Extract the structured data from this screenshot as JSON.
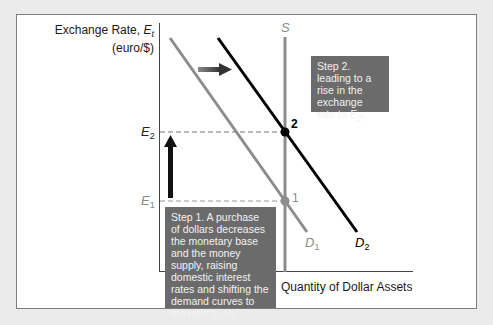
{
  "diagram": {
    "y_axis": {
      "title": "Exchange Rate, ",
      "title_var": "E",
      "title_sub": "t",
      "unit": "(euro/$)"
    },
    "x_axis": {
      "title": "Quantity of Dollar Assets"
    },
    "ticks": {
      "e2": {
        "var": "E",
        "sub": "2"
      },
      "e1": {
        "var": "E",
        "sub": "1"
      }
    },
    "curves": {
      "supply": {
        "label": "S",
        "color": "#8c8c8c"
      },
      "d1": {
        "var": "D",
        "sub": "1",
        "color": "#8c8c8c"
      },
      "d2": {
        "var": "D",
        "sub": "2",
        "color": "#000000"
      }
    },
    "points": [
      {
        "label": "1",
        "color": "#8c8c8c"
      },
      {
        "label": "2",
        "color": "#000000"
      }
    ],
    "annotations": {
      "step1": {
        "text": "Step 1. A purchase of dollars decreases the monetary base and the money supply, raising domestic interest rates and shifting the demand curves to the right to ",
        "end_var": "D",
        "end_sub": "2",
        "end_tail": " . . ."
      },
      "step2": {
        "text": "Step 2. leading to a rise in the exchange rate to ",
        "end_var": "E",
        "end_sub": "2",
        "end_tail": "."
      }
    },
    "arrows": [
      {
        "name": "demand-shift-arrow",
        "direction": "right"
      },
      {
        "name": "exchange-rate-rise-arrow",
        "direction": "up"
      }
    ],
    "colors": {
      "background": "#ebebeb",
      "panel": "#ffffff",
      "callout_box": "#6b6b6b",
      "callout_text": "#f2f2f2"
    }
  }
}
